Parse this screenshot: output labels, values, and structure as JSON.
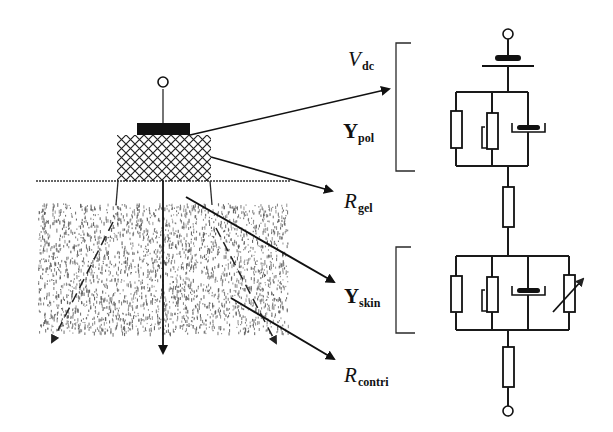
{
  "figure": {
    "colors": {
      "ink": "#111111",
      "tissue": "#5a5a5a",
      "background": "#ffffff"
    }
  },
  "labels": {
    "vdc": {
      "main": "V",
      "sub": "dc"
    },
    "ypol": {
      "main": "Y",
      "sub": "pol"
    },
    "rgel": {
      "main": "R",
      "sub": "gel"
    },
    "yskin": {
      "main": "Y",
      "sub": "skin"
    },
    "rcontri": {
      "main": "R",
      "sub": "contri"
    }
  },
  "circuit": {
    "groups": [
      {
        "name": "Vdc",
        "elements": [
          "dc-source"
        ]
      },
      {
        "name": "Ypol",
        "elements": [
          "resistor",
          "resistor-with-bypass",
          "constant-phase-element"
        ]
      },
      {
        "name": "Rgel",
        "elements": [
          "resistor"
        ]
      },
      {
        "name": "Yskin",
        "elements": [
          "resistor",
          "resistor-with-bypass",
          "constant-phase-element",
          "variable-resistor"
        ]
      },
      {
        "name": "Rcontri",
        "elements": [
          "resistor"
        ]
      }
    ]
  }
}
